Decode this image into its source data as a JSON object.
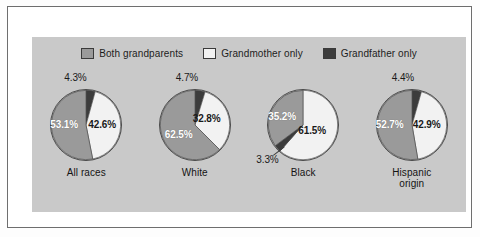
{
  "chart_data": {
    "type": "pie",
    "title": "",
    "subtitle": "",
    "xlabel": "",
    "ylabel": "",
    "legend_position": "top-center",
    "grid": false,
    "legend": [
      {
        "name": "Both grandparents",
        "color": "#9a9a9a",
        "swatch": "medium-gray"
      },
      {
        "name": "Grandmother only",
        "color": "#f2f2f2",
        "swatch": "white"
      },
      {
        "name": "Grandfather only",
        "color": "#3c3c3c",
        "swatch": "dark-gray"
      }
    ],
    "categories": [
      "All races",
      "White",
      "Black",
      "Hispanic origin"
    ],
    "series": [
      {
        "name": "Both grandparents",
        "values": [
          53.1,
          62.5,
          35.2,
          52.7
        ]
      },
      {
        "name": "Grandmother only",
        "values": [
          42.6,
          32.8,
          61.5,
          42.9
        ]
      },
      {
        "name": "Grandfather only",
        "values": [
          4.3,
          4.7,
          3.3,
          4.4
        ]
      }
    ],
    "units": "percent",
    "pies": [
      {
        "category": "All races",
        "category_lines": [
          "All races"
        ],
        "slices": [
          {
            "label": "Grandfather only",
            "value": 4.3,
            "text": "4.3%",
            "color": "#3c3c3c",
            "placement": "callout-top"
          },
          {
            "label": "Grandmother only",
            "value": 42.6,
            "text": "42.6%",
            "color": "#f2f2f2",
            "placement": "inside-right"
          },
          {
            "label": "Both grandparents",
            "value": 53.1,
            "text": "53.1%",
            "color": "#9a9a9a",
            "placement": "inside-left"
          }
        ]
      },
      {
        "category": "White",
        "category_lines": [
          "White"
        ],
        "slices": [
          {
            "label": "Grandfather only",
            "value": 4.7,
            "text": "4.7%",
            "color": "#3c3c3c",
            "placement": "callout-top"
          },
          {
            "label": "Grandmother only",
            "value": 32.8,
            "text": "32.8%",
            "color": "#f2f2f2",
            "placement": "inside-right"
          },
          {
            "label": "Both grandparents",
            "value": 62.5,
            "text": "62.5%",
            "color": "#9a9a9a",
            "placement": "inside-left"
          }
        ]
      },
      {
        "category": "Black",
        "category_lines": [
          "Black"
        ],
        "slices": [
          {
            "label": "Grandmother only",
            "value": 61.5,
            "text": "61.5%",
            "color": "#f2f2f2",
            "placement": "inside-right"
          },
          {
            "label": "Grandfather only",
            "value": 3.3,
            "text": "3.3%",
            "color": "#3c3c3c",
            "placement": "callout-bottom-left"
          },
          {
            "label": "Both grandparents",
            "value": 35.2,
            "text": "35.2%",
            "color": "#9a9a9a",
            "placement": "inside-left"
          }
        ]
      },
      {
        "category": "Hispanic origin",
        "category_lines": [
          "Hispanic",
          "origin"
        ],
        "slices": [
          {
            "label": "Grandfather only",
            "value": 4.4,
            "text": "4.4%",
            "color": "#3c3c3c",
            "placement": "callout-top"
          },
          {
            "label": "Grandmother only",
            "value": 42.9,
            "text": "42.9%",
            "color": "#f2f2f2",
            "placement": "inside-right"
          },
          {
            "label": "Both grandparents",
            "value": 52.7,
            "text": "52.7%",
            "color": "#9a9a9a",
            "placement": "inside-left"
          }
        ]
      }
    ]
  },
  "colors": {
    "both_grandparents": "#9a9a9a",
    "grandmother_only": "#f2f2f2",
    "grandfather_only": "#3c3c3c",
    "panel_background": "#c9c9c9",
    "page_background": "#ffffff",
    "outline": "#4a4a4a"
  }
}
